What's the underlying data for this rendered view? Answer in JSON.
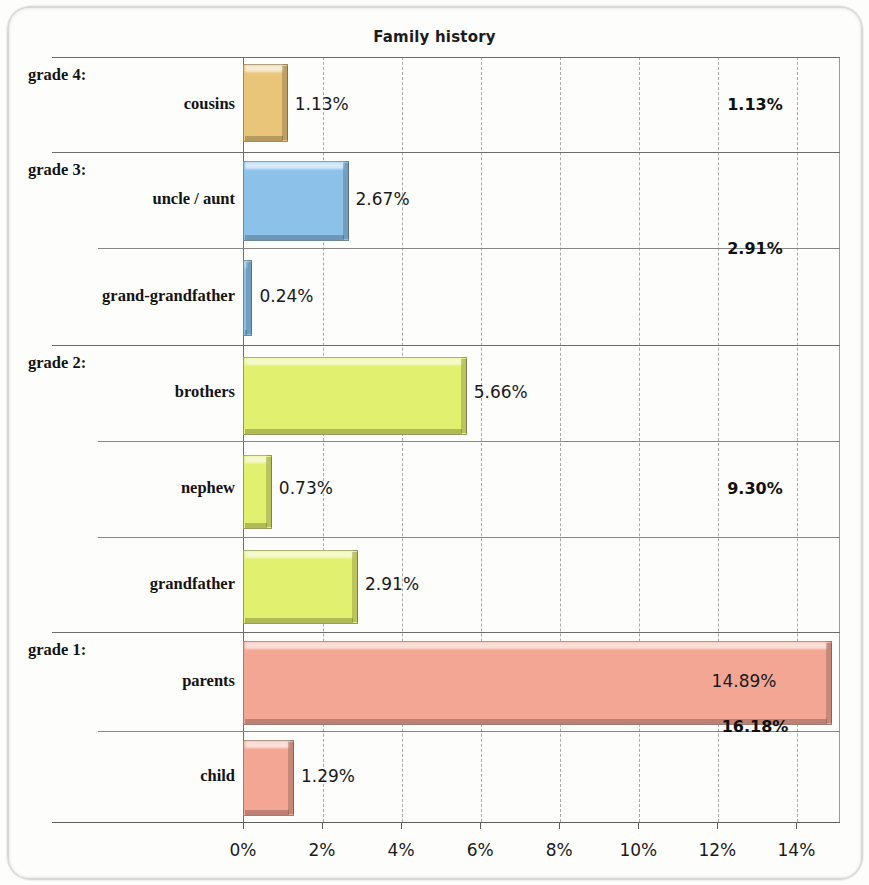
{
  "chart_data": {
    "type": "bar",
    "orientation": "horizontal",
    "title": "Family history",
    "xlabel": "",
    "ylabel": "",
    "xlim": [
      0,
      15.1
    ],
    "grid": true,
    "legend": "none",
    "tick_labels": [
      "0%",
      "2%",
      "4%",
      "6%",
      "8%",
      "10%",
      "12%",
      "14%"
    ],
    "tick_values": [
      0,
      2,
      4,
      6,
      8,
      10,
      12,
      14
    ],
    "groups": [
      {
        "grade_label": "grade 4:",
        "total": 1.13,
        "total_label": "1.13%",
        "color": "#e8c578",
        "items": [
          {
            "category": "cousins",
            "value": 1.13,
            "value_label": "1.13%"
          }
        ]
      },
      {
        "grade_label": "grade 3:",
        "total": 2.91,
        "total_label": "2.91%",
        "color": "#8cc2ea",
        "items": [
          {
            "category": "uncle / aunt",
            "value": 2.67,
            "value_label": "2.67%"
          },
          {
            "category": "grand-grandfather",
            "value": 0.24,
            "value_label": "0.24%"
          }
        ]
      },
      {
        "grade_label": "grade 2:",
        "total": 9.3,
        "total_label": "9.30%",
        "color": "#e2f070",
        "items": [
          {
            "category": "brothers",
            "value": 5.66,
            "value_label": "5.66%"
          },
          {
            "category": "nephew",
            "value": 0.73,
            "value_label": "0.73%"
          },
          {
            "category": "grandfather",
            "value": 2.91,
            "value_label": "2.91%"
          }
        ]
      },
      {
        "grade_label": "grade 1:",
        "total": 16.18,
        "total_label": "16.18%",
        "color": "#f3a694",
        "items": [
          {
            "category": "parents",
            "value": 14.89,
            "value_label": "14.89%"
          },
          {
            "category": "child",
            "value": 1.29,
            "value_label": "1.29%"
          }
        ]
      }
    ]
  },
  "layout": {
    "plot_left": 243,
    "plot_right": 840,
    "plot_top": 57,
    "plot_bottom": 822,
    "px_per_percent": 39.53,
    "rows": [
      {
        "top": 57,
        "bottom": 152,
        "bar_top": 64,
        "bar_height": 78
      },
      {
        "top": 152,
        "bottom": 248,
        "bar_top": 161,
        "bar_height": 80
      },
      {
        "top": 248,
        "bottom": 345,
        "bar_top": 260,
        "bar_height": 76
      },
      {
        "top": 345,
        "bottom": 441,
        "bar_top": 357,
        "bar_height": 78
      },
      {
        "top": 441,
        "bottom": 537,
        "bar_top": 455,
        "bar_height": 74
      },
      {
        "top": 537,
        "bottom": 632,
        "bar_top": 550,
        "bar_height": 74
      },
      {
        "top": 632,
        "bottom": 731,
        "bar_top": 641,
        "bar_height": 84
      },
      {
        "top": 731,
        "bottom": 822,
        "bar_top": 740,
        "bar_height": 76
      }
    ],
    "grade_divider_left": 52,
    "sub_divider_left": 98,
    "total_center_x": 755
  }
}
